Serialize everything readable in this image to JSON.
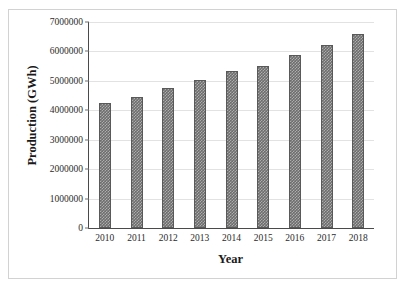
{
  "chart_data": {
    "type": "bar",
    "title": "",
    "xlabel": "Year",
    "ylabel": "Production (GWh)",
    "categories": [
      "2010",
      "2011",
      "2012",
      "2013",
      "2014",
      "2015",
      "2016",
      "2017",
      "2018"
    ],
    "values": [
      4250000,
      4450000,
      4760000,
      5030000,
      5340000,
      5500000,
      5880000,
      6220000,
      6600000
    ],
    "ylim": [
      0,
      7000000
    ],
    "ytick_values": [
      0,
      1000000,
      2000000,
      3000000,
      4000000,
      5000000,
      6000000,
      7000000
    ],
    "ytick_labels": [
      "0",
      "1000000",
      "2000000",
      "3000000",
      "4000000",
      "5000000",
      "6000000",
      "7000000"
    ],
    "grid": true,
    "legend": false,
    "legend_position": "none",
    "series": [
      {
        "name": "Production",
        "values": [
          4250000,
          4450000,
          4760000,
          5030000,
          5340000,
          5500000,
          5880000,
          6220000,
          6600000
        ]
      }
    ]
  },
  "style": {
    "bar_color": "#6d6d6d",
    "bar_edge_color": "#595959",
    "grid_color": "#e2e2e2",
    "axis_color": "#4a4a4a",
    "frame_color": "#d2d2d2",
    "background": "#ffffff",
    "text_color": "#1a1a1a"
  }
}
